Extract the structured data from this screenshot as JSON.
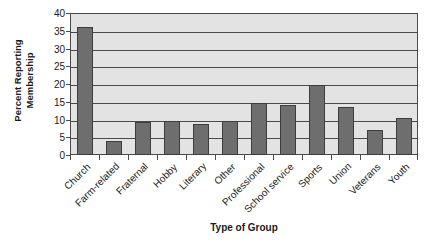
{
  "chart_data": {
    "type": "bar",
    "title": "",
    "subtitle": "",
    "xlabel": "Type of Group",
    "ylabel": "Percent Reporting Membership",
    "ylabel_line1": "Percent Reporting",
    "ylabel_line2": "Membership",
    "categories": [
      "Church",
      "Farm-related",
      "Fraternal",
      "Hobby",
      "Literary",
      "Other",
      "Professional",
      "School service",
      "Sports",
      "Union",
      "Veterans",
      "Youth"
    ],
    "values": [
      36,
      4,
      9.2,
      9.5,
      8.7,
      9.7,
      14.7,
      14,
      19.8,
      13.6,
      7,
      10.3
    ],
    "ylim": [
      0,
      40
    ],
    "yticks": [
      0,
      5,
      10,
      15,
      20,
      25,
      30,
      35,
      40
    ],
    "ytick_labels": [
      "0",
      "5",
      "10",
      "15",
      "20",
      "25",
      "30",
      "35",
      "40"
    ],
    "grid": true,
    "grid_axis": "y",
    "legend": false,
    "legend_position": "none",
    "bar_color": "#6e6e6e",
    "bar_edge_color": "#3d3d3d",
    "plot_background_color": "#e3e3e3",
    "axis_color": "#4a4a4a",
    "figure_background_color": "#ffffff"
  }
}
